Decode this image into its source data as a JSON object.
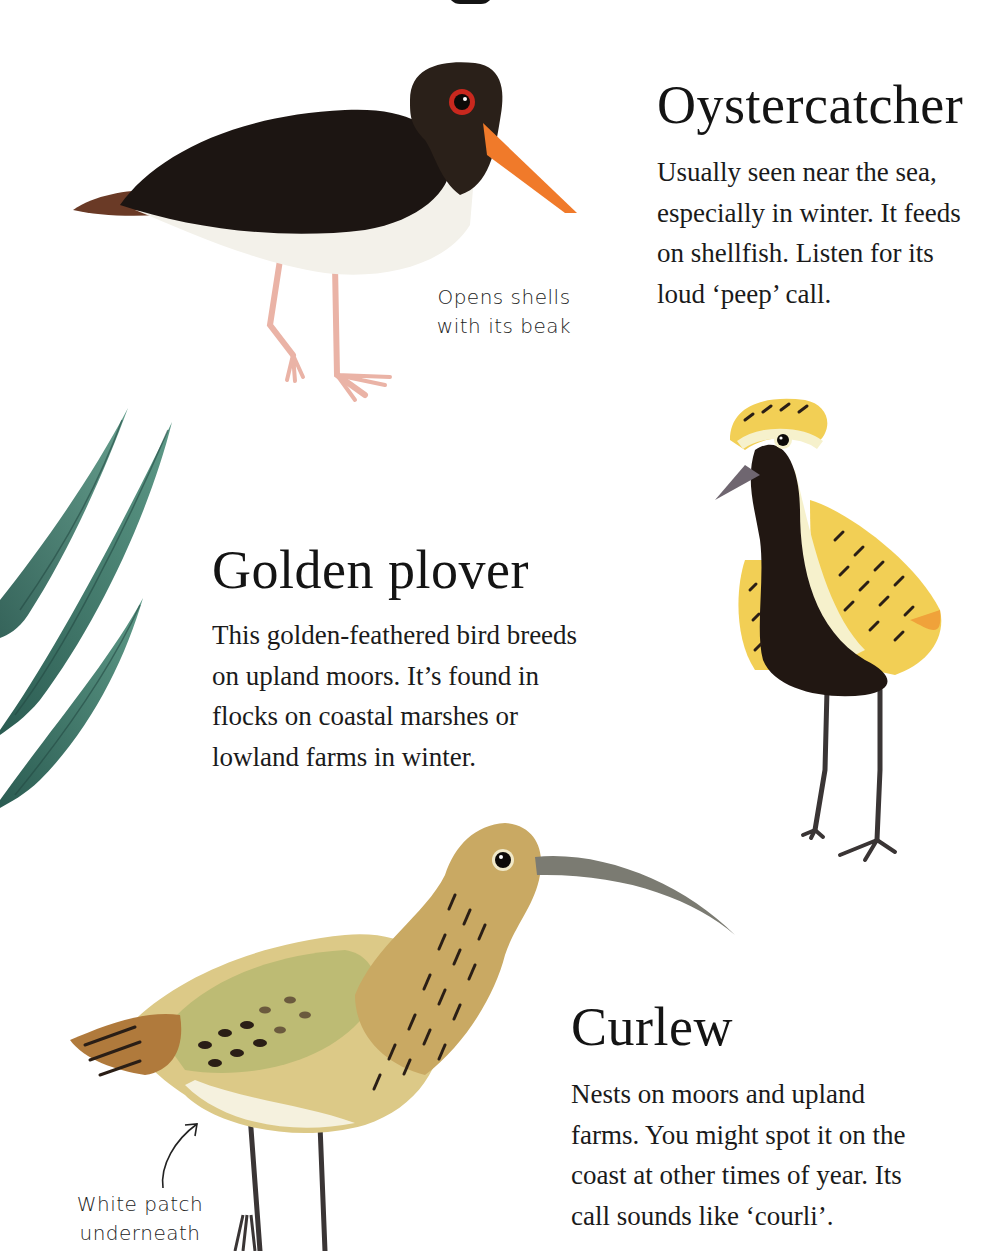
{
  "page": {
    "background": "#ffffff"
  },
  "birds": [
    {
      "name": "Oystercatcher",
      "description_lines": [
        "Usually seen near the sea,",
        "especially in winter. It feeds",
        "on shellfish. Listen for its",
        "loud ‘peep’ call."
      ],
      "annotation_lines": [
        "Opens shells",
        "with its beak"
      ],
      "colors": {
        "body": "#1c1512",
        "head": "#2a2019",
        "beak": "#f07a2a",
        "eye_ring": "#c8281e",
        "belly": "#f3f1ea",
        "legs": "#eab3a6",
        "tail": "#6a3a26"
      }
    },
    {
      "name": "Golden plover",
      "description_lines": [
        "This golden-feathered bird breeds",
        "on upland moors. It’s found in",
        "flocks on coastal marshes or",
        "lowland farms in winter."
      ],
      "colors": {
        "body": "#211712",
        "wing": "#f2cf55",
        "wing_edge": "#f0a23a",
        "cream": "#f6f1cc",
        "beak": "#6f6670",
        "legs": "#3a3535"
      }
    },
    {
      "name": "Curlew",
      "description_lines": [
        "Nests on moors and upland",
        "farms. You might spot it on the",
        "coast at other times of year. Its",
        "call sounds like ‘courli’."
      ],
      "annotation_lines": [
        "White patch",
        "underneath"
      ],
      "colors": {
        "body": "#dcc987",
        "wing": "#bdbb74",
        "neck": "#c9a963",
        "tail": "#b07a3c",
        "beak": "#7b7b72",
        "legs": "#3a3535",
        "streaks": "#2a1e16"
      }
    }
  ],
  "decor": {
    "leaves_color": "#3f7c6e",
    "leaves_dark": "#2b5c52"
  }
}
